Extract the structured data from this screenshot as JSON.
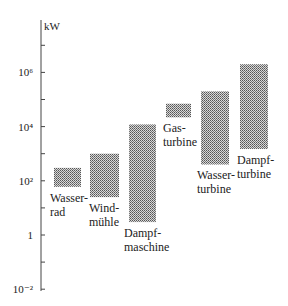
{
  "chart_data": {
    "type": "bar",
    "subtype": "floating-range",
    "title": "",
    "xlabel": "",
    "ylabel": "kW",
    "yscale": "log",
    "ylim": [
      0.01,
      10000000
    ],
    "yticks": [
      {
        "value": 10000000,
        "label": ""
      },
      {
        "value": 1000000,
        "label": "10⁶"
      },
      {
        "value": 100000,
        "label": ""
      },
      {
        "value": 10000,
        "label": "10⁴"
      },
      {
        "value": 1000,
        "label": ""
      },
      {
        "value": 100,
        "label": "10²"
      },
      {
        "value": 10,
        "label": ""
      },
      {
        "value": 1,
        "label": "1"
      },
      {
        "value": 0.1,
        "label": ""
      },
      {
        "value": 0.01,
        "label": "10⁻²"
      }
    ],
    "grid": false,
    "fill_pattern": "dotted-gray",
    "series": [
      {
        "name": "Wasserrad",
        "label_lines": [
          "Wasser-",
          "rad"
        ],
        "min": 60,
        "max": 300
      },
      {
        "name": "Windmühle",
        "label_lines": [
          "Wind-",
          "mühle"
        ],
        "min": 25,
        "max": 1000
      },
      {
        "name": "Dampfmaschine",
        "label_lines": [
          "Dampf-",
          "maschine"
        ],
        "min": 3,
        "max": 12000
      },
      {
        "name": "Gasturbine",
        "label_lines": [
          "Gas-",
          "turbine"
        ],
        "min": 22000,
        "max": 70000
      },
      {
        "name": "Wasserturbine",
        "label_lines": [
          "Wasser-",
          "turbine"
        ],
        "min": 400,
        "max": 200000
      },
      {
        "name": "Dampfturbine",
        "label_lines": [
          "Dampf-",
          "turbine"
        ],
        "min": 1500,
        "max": 2000000
      }
    ]
  }
}
